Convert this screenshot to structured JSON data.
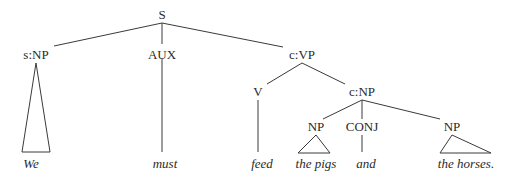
{
  "diagram": {
    "type": "syntax-tree",
    "nodes": {
      "S": "S",
      "subject_np": "s:NP",
      "aux": "AUX",
      "vp": "c:VP",
      "verb": "V",
      "object_np": "c:NP",
      "np1": "NP",
      "conj": "CONJ",
      "np2": "NP"
    },
    "words": {
      "we": "We",
      "must": "must",
      "feed": "feed",
      "the_pigs": "the pigs",
      "and": "and",
      "the_horses": "the horses."
    }
  }
}
